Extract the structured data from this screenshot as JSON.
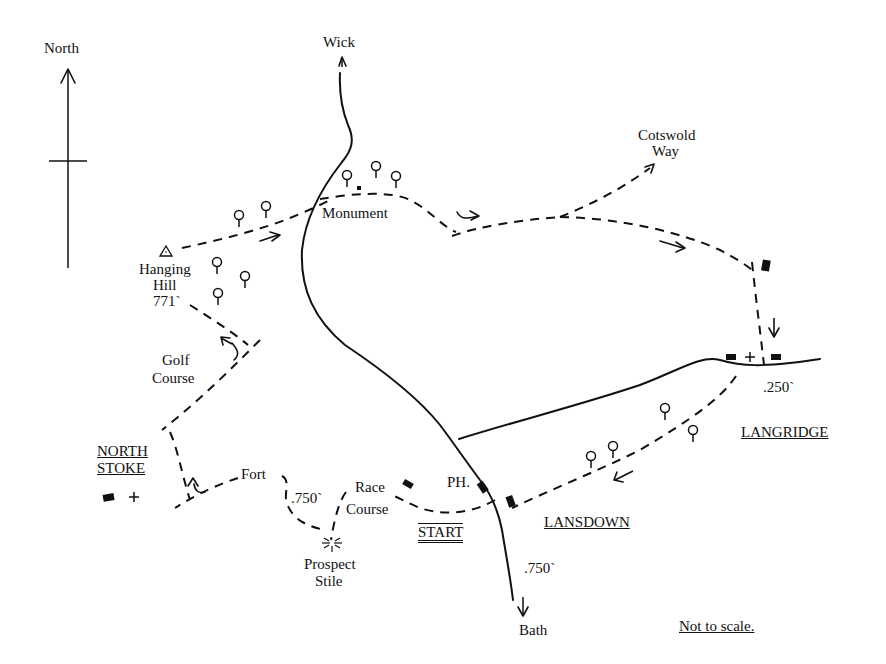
{
  "map": {
    "compass": {
      "label": "North"
    },
    "places": {
      "wick": "Wick",
      "cotswold_way_1": "Cotswold",
      "cotswold_way_2": "Way",
      "monument": "Monument",
      "hanging_hill_1": "Hanging",
      "hanging_hill_2": "Hill",
      "hanging_hill_height": "771`",
      "golf_course_1": "Golf",
      "golf_course_2": "Course",
      "north_stoke_1": "NORTH",
      "north_stoke_2": "STOKE",
      "fort": "Fort",
      "fort_height": ".750`",
      "race_course_1": "Race",
      "race_course_2": "Course",
      "prospect_stile_1": "Prospect",
      "prospect_stile_2": "Stile",
      "start": "START",
      "ph": "PH.",
      "lansdown": "LANSDOWN",
      "langridge": "LANGRIDGE",
      "langridge_height": ".250`",
      "bath_height": ".750`",
      "bath": "Bath"
    },
    "note": "Not to scale.",
    "symbols": {
      "tree": "tree-icon",
      "building": "building-icon",
      "church": "church-cross-icon",
      "trig_point": "triangle-trig-point-icon",
      "viewpoint": "viewpoint-star-icon",
      "direction": "arrow-icon"
    }
  }
}
